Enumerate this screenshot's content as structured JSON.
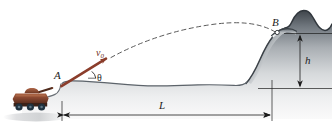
{
  "figure": {
    "labels": {
      "point_a": "A",
      "point_b": "B",
      "range": "L",
      "height": "h",
      "angle": "θ",
      "velocity_symbol": "v",
      "velocity_subscript": "0"
    },
    "colors": {
      "velocity_arrow": "#8b3d2b",
      "terrain_dark": "#4a4f55",
      "terrain_light": "#f2f3f4",
      "trajectory": "#585858",
      "dimension_line": "#1c1c1c",
      "tank_body": "#8a4a33",
      "tank_dark": "#3a2118",
      "background": "#ffffff"
    },
    "elements": {
      "tank": "tank-vehicle",
      "trajectory": "dashed-parabolic-trajectory",
      "terrain": "terrain-profile",
      "launch_arrow": "initial-velocity-vector",
      "angle_arc": "launch-angle-arc",
      "range_dimension": "horizontal-range-dimension",
      "height_dimension": "vertical-height-dimension"
    }
  }
}
